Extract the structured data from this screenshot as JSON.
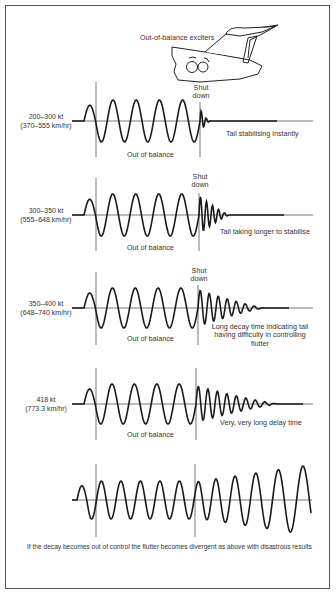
{
  "diagram": {
    "header_label": "Out-of-balance exciters",
    "shutdown_label_line1": "Shut",
    "shutdown_label_line2": "down",
    "out_of_balance_label": "Out of balance",
    "panels": [
      {
        "speed_kt": "200–300 kt",
        "speed_kmh": "(370–555 km/hr)",
        "note": "Tail stabilising instantly",
        "decay": "instant"
      },
      {
        "speed_kt": "300–350 kt",
        "speed_kmh": "(555–648 km/hr)",
        "note": "Tail taking longer to stabilise",
        "decay": "short"
      },
      {
        "speed_kt": "350–400 kt",
        "speed_kmh": "(648–740 km/hr)",
        "note_lines": [
          "Long decay time indicating tail",
          "having difficulty in controlling",
          "flutter"
        ],
        "decay": "long"
      },
      {
        "speed_kt": "418 kt",
        "speed_kmh": "(773.3 km/hr)",
        "note": "Very, very long delay time",
        "decay": "very-long"
      },
      {
        "speed_kt": "",
        "speed_kmh": "",
        "note": "",
        "decay": "divergent"
      }
    ],
    "caption": "If the decay becomes out of control the flutter becomes divergent as above with disastrous results",
    "colors": {
      "line": "#1a1a1a",
      "thin_line": "#555555",
      "text": "#333333",
      "background": "#ffffff"
    }
  }
}
